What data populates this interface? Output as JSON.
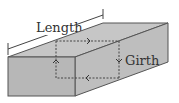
{
  "diagram": {
    "type": "box-dimension-illustration",
    "labels": {
      "length": "Length",
      "girth": "Girth"
    },
    "colors": {
      "top_face": "#c4c4c4",
      "front_face": "#b5b5b5",
      "side_face": "#bdbdbd",
      "edge": "#555555",
      "dashed": "#555555",
      "background": "#ffffff"
    },
    "arrows": [
      {
        "position": "top",
        "direction": "right"
      },
      {
        "position": "right",
        "direction": "down"
      },
      {
        "position": "bottom",
        "direction": "left"
      },
      {
        "position": "left",
        "direction": "up"
      }
    ]
  }
}
